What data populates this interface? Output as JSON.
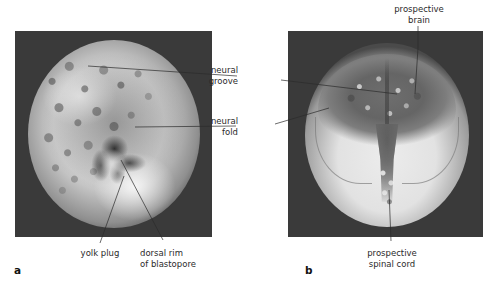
{
  "figure": {
    "background_color": "#ffffff",
    "panel_background_color": "#3a3a3a"
  },
  "panels": [
    {
      "letter": "a",
      "name": "neurula-early-dorsal-view",
      "labels": [
        {
          "id": "yolk-plug",
          "text_lines": [
            "yolk plug"
          ]
        },
        {
          "id": "dorsal-rim-of-blastopore",
          "text_lines": [
            "dorsal rim",
            "of blastopore"
          ]
        }
      ]
    },
    {
      "letter": "b",
      "name": "neurula-late-dorsal-view",
      "labels": [
        {
          "id": "prospective-brain",
          "text_lines": [
            "prospective",
            "brain"
          ]
        },
        {
          "id": "prospective-spinal-cord",
          "text_lines": [
            "prospective",
            "spinal cord"
          ]
        }
      ]
    }
  ],
  "shared_labels": [
    {
      "id": "neural-groove",
      "text_lines": [
        "neural",
        "groove"
      ]
    },
    {
      "id": "neural-fold",
      "text_lines": [
        "neural",
        "fold"
      ]
    }
  ],
  "text": {
    "panel_a_letter": "a",
    "panel_b_letter": "b",
    "yolk_plug": "yolk plug",
    "dorsal_rim_line1": "dorsal rim",
    "dorsal_rim_line2": "of blastopore",
    "neural_groove_line1": "neural",
    "neural_groove_line2": "groove",
    "neural_fold_line1": "neural",
    "neural_fold_line2": "fold",
    "prospective_brain_line1": "prospective",
    "prospective_brain_line2": "brain",
    "prospective_spinal_cord_line1": "prospective",
    "prospective_spinal_cord_line2": "spinal cord"
  }
}
